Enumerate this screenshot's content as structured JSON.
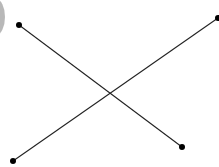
{
  "diagram": {
    "colors": {
      "background": "#ffffff",
      "line": "#222222",
      "point": "#000000",
      "edge_circle": "#b8b8b8"
    },
    "points": [
      {
        "id": "A",
        "label": ""
      },
      {
        "id": "B",
        "label": ""
      },
      {
        "id": "C",
        "label": ""
      },
      {
        "id": "D",
        "label": ""
      }
    ],
    "segments": [
      {
        "id": "AB",
        "from": "A",
        "to": "B"
      },
      {
        "id": "CD",
        "from": "C",
        "to": "D"
      }
    ]
  }
}
